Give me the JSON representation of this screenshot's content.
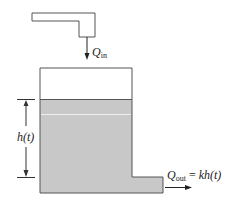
{
  "diagram": {
    "labels": {
      "inflow_symbol": "Q",
      "inflow_subscript": "in",
      "outflow_symbol": "Q",
      "outflow_subscript": "out",
      "outflow_equals": "=",
      "outflow_expression": "kh(t)",
      "height_label": "h(t)"
    },
    "colors": {
      "outline": "#555555",
      "water": "#c8c8c8",
      "water_line": "#eeeeee",
      "background": "#ffffff"
    }
  }
}
